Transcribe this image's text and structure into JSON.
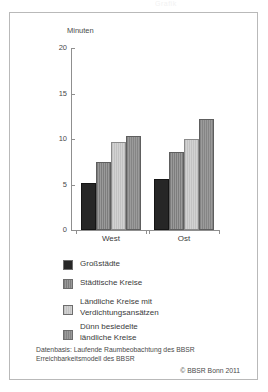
{
  "ghost_title": "Grafik",
  "chart_data": {
    "type": "bar",
    "title": "",
    "xlabel": "",
    "ylabel": "Minuten",
    "ylim": [
      0,
      20
    ],
    "yticks": [
      "0",
      "5",
      "10",
      "15",
      "20"
    ],
    "grid": false,
    "legend_position": "below",
    "categories": [
      "West",
      "Ost"
    ],
    "series": [
      {
        "name": "Großstädte",
        "values": [
          5.2,
          5.6
        ],
        "color": "#262626"
      },
      {
        "name": "Städtische Kreise",
        "values": [
          7.5,
          8.6
        ],
        "color": "#8c8c8c"
      },
      {
        "name": "Ländliche Kreise mit Verdichtungsansätzen",
        "values": [
          9.7,
          10.0
        ],
        "color": "#c9c9c9"
      },
      {
        "name": "Dünn besiedelte ländliche Kreise",
        "values": [
          10.3,
          12.2
        ],
        "color": "#8f8f8f"
      }
    ]
  },
  "legend": {
    "items": [
      {
        "label": "Großstädte",
        "line1": "Großstädte",
        "line2": ""
      },
      {
        "label": "Städtische Kreise",
        "line1": "Städtische Kreise",
        "line2": ""
      },
      {
        "label": "Ländliche Kreise mit Verdichtungsansätzen",
        "line1": "Ländliche Kreise mit",
        "line2": "Verdichtungsansätzen"
      },
      {
        "label": "Dünn besiedelte ländliche Kreise",
        "line1": "Dünn besiedelte",
        "line2": "ländliche Kreise"
      }
    ]
  },
  "footer": {
    "source_line1": "Datenbasis: Laufende Raumbeobachtung des BBSR",
    "source_line2": "Erreichbarkeitsmodell des BBSR",
    "copyright": "© BBSR Bonn 2011"
  }
}
